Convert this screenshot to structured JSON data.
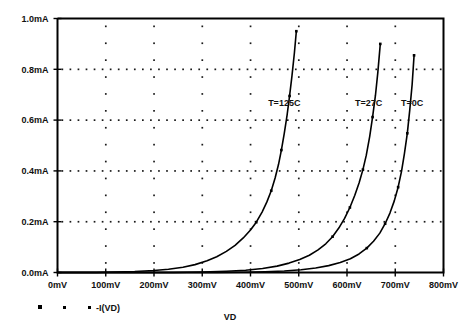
{
  "chart_data": {
    "type": "line",
    "title": "",
    "xlabel": "VD",
    "ylabel": "",
    "xlim": [
      0,
      800
    ],
    "ylim": [
      0,
      1.0
    ],
    "x_unit": "mV",
    "y_unit": "mA",
    "grid": true,
    "grid_style": "dotted",
    "legend_position": "bottom-left",
    "legend_entries": [
      "-I(VD)"
    ],
    "xticks": [
      0,
      100,
      200,
      300,
      400,
      500,
      600,
      700,
      800
    ],
    "xtick_labels": [
      "0mV",
      "100mV",
      "200mV",
      "300mV",
      "400mV",
      "500mV",
      "600mV",
      "700mV",
      "800mV"
    ],
    "yticks": [
      0.0,
      0.2,
      0.4,
      0.6,
      0.8,
      1.0
    ],
    "ytick_labels": [
      "0.0mA",
      "0.2mA",
      "0.4mA",
      "0.6mA",
      "0.8mA",
      "1.0mA"
    ],
    "annotations": [
      {
        "text": "T=125C",
        "x": 470,
        "y": 0.655
      },
      {
        "text": "T=27C",
        "x": 645,
        "y": 0.655
      },
      {
        "text": "T=0C",
        "x": 735,
        "y": 0.655
      }
    ],
    "series": [
      {
        "name": "T=125C",
        "x": [
          0,
          40,
          80,
          120,
          160,
          200,
          230,
          260,
          285,
          310,
          330,
          350,
          368,
          385,
          400,
          412,
          424,
          434,
          443,
          451,
          458,
          464,
          470,
          476,
          481,
          486,
          491,
          495
        ],
        "y": [
          0.0,
          0.0,
          0.0,
          0.002,
          0.004,
          0.008,
          0.013,
          0.021,
          0.031,
          0.046,
          0.062,
          0.083,
          0.107,
          0.136,
          0.167,
          0.198,
          0.238,
          0.278,
          0.322,
          0.372,
          0.425,
          0.482,
          0.548,
          0.622,
          0.695,
          0.775,
          0.865,
          0.95
        ]
      },
      {
        "name": "T=27C",
        "x": [
          0,
          60,
          120,
          180,
          240,
          300,
          350,
          390,
          425,
          455,
          480,
          502,
          522,
          540,
          556,
          570,
          583,
          595,
          606,
          616,
          625,
          633,
          640,
          647,
          653,
          659,
          664,
          669
        ],
        "y": [
          0.0,
          0.0,
          0.0,
          0.0,
          0.0,
          0.002,
          0.005,
          0.009,
          0.016,
          0.025,
          0.037,
          0.051,
          0.068,
          0.089,
          0.113,
          0.141,
          0.175,
          0.213,
          0.256,
          0.303,
          0.352,
          0.405,
          0.462,
          0.535,
          0.612,
          0.698,
          0.79,
          0.9
        ]
      },
      {
        "name": "T=0C",
        "x": [
          0,
          70,
          140,
          210,
          270,
          330,
          385,
          430,
          470,
          505,
          535,
          562,
          586,
          607,
          625,
          641,
          655,
          668,
          679,
          689,
          698,
          706,
          713,
          719,
          725,
          730,
          735,
          739
        ],
        "y": [
          0.0,
          0.0,
          0.0,
          0.0,
          0.0,
          0.0,
          0.001,
          0.003,
          0.006,
          0.011,
          0.018,
          0.027,
          0.039,
          0.054,
          0.073,
          0.096,
          0.123,
          0.155,
          0.192,
          0.234,
          0.282,
          0.336,
          0.398,
          0.468,
          0.548,
          0.638,
          0.74,
          0.855
        ]
      }
    ]
  },
  "legend": {
    "marker_count": 3,
    "label": "-I(VD)"
  },
  "axis": {
    "x_title": "VD"
  }
}
